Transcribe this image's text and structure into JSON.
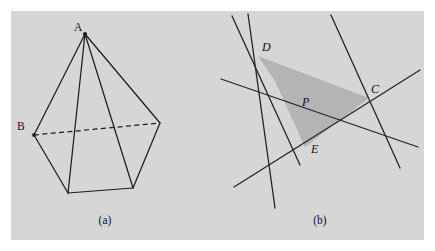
{
  "figure": {
    "background_color": "#ffffff",
    "panel_color": "#d6d6d6",
    "ink_color": "#1d1d1d",
    "shade_color": "#b4b4b4",
    "panel": {
      "x": 11,
      "y": 11,
      "width": 413,
      "height": 229
    }
  },
  "panel_a": {
    "caption": "(a)",
    "caption_pos": {
      "x": 105,
      "y": 224
    },
    "description": "pyramid with hidden edge shown dashed",
    "labels": [
      {
        "id": "A",
        "text": "A",
        "x": 74,
        "y": 31
      },
      {
        "id": "B",
        "text": "B",
        "x": 17,
        "y": 130
      }
    ],
    "vertices": {
      "apex": {
        "x": 85,
        "y": 34
      },
      "left": {
        "x": 34,
        "y": 135
      },
      "right": {
        "x": 160,
        "y": 123
      },
      "front_left": {
        "x": 68,
        "y": 193
      },
      "front_right": {
        "x": 133,
        "y": 188
      }
    },
    "solid_edges": [
      {
        "from": "apex",
        "to": "left"
      },
      {
        "from": "apex",
        "to": "right"
      },
      {
        "from": "apex",
        "to": "front_left"
      },
      {
        "from": "apex",
        "to": "front_right"
      },
      {
        "from": "left",
        "to": "front_left"
      },
      {
        "from": "front_left",
        "to": "front_right"
      },
      {
        "from": "front_right",
        "to": "right"
      }
    ],
    "dashed_edges": [
      {
        "from": "left",
        "to": "right"
      }
    ],
    "marked_vertices": [
      {
        "x": 85,
        "y": 34
      },
      {
        "x": 34,
        "y": 135
      }
    ]
  },
  "panel_b": {
    "caption": "(b)",
    "caption_pos": {
      "x": 320,
      "y": 224
    },
    "description": "arrangement of five lines bounding a shaded quadrilateral region P",
    "labels": [
      {
        "id": "D",
        "text": "D",
        "x": 262,
        "y": 51
      },
      {
        "id": "C",
        "text": "C",
        "x": 371,
        "y": 93
      },
      {
        "id": "E",
        "text": "E",
        "x": 311,
        "y": 153
      },
      {
        "id": "P",
        "text": "P",
        "x": 302,
        "y": 106
      }
    ],
    "lines": [
      {
        "id": "line-1",
        "x1": 232,
        "y1": 16,
        "x2": 300,
        "y2": 165
      },
      {
        "id": "line-2",
        "x1": 248,
        "y1": 14,
        "x2": 275,
        "y2": 208
      },
      {
        "id": "line-3",
        "x1": 221,
        "y1": 79,
        "x2": 418,
        "y2": 147
      },
      {
        "id": "line-4",
        "x1": 331,
        "y1": 15,
        "x2": 400,
        "y2": 168
      },
      {
        "id": "line-5",
        "x1": 234,
        "y1": 187,
        "x2": 420,
        "y2": 70
      }
    ],
    "region_P": {
      "label": "P",
      "vertices": [
        {
          "x": 258,
          "y": 56
        },
        {
          "x": 369,
          "y": 98
        },
        {
          "x": 305,
          "y": 147
        },
        {
          "x": 275,
          "y": 81
        }
      ]
    },
    "intersection_points": [
      {
        "id": "D",
        "x": 258,
        "y": 56
      },
      {
        "id": "C",
        "x": 369,
        "y": 98
      },
      {
        "id": "E",
        "x": 305,
        "y": 147
      }
    ]
  }
}
